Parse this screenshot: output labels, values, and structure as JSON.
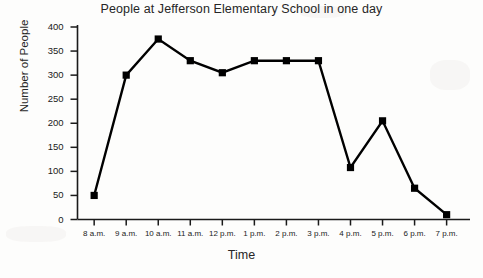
{
  "chart_data": {
    "type": "line",
    "title": "People at Jefferson Elementary School in one day",
    "xlabel": "Time",
    "ylabel": "Number of People",
    "categories": [
      "8 a.m.",
      "9 a.m.",
      "10 a.m.",
      "11 a.m.",
      "12 p.m.",
      "1 p.m.",
      "2 p.m.",
      "3 p.m.",
      "4 p.m.",
      "5 p.m.",
      "6 p.m.",
      "7 p.m."
    ],
    "values": [
      50,
      300,
      375,
      330,
      305,
      330,
      330,
      330,
      108,
      205,
      65,
      10
    ],
    "series": [
      {
        "name": "Number of People",
        "values": [
          50,
          300,
          375,
          330,
          305,
          330,
          330,
          330,
          108,
          205,
          65,
          10
        ]
      }
    ],
    "ylim": [
      0,
      400
    ],
    "yticks": [
      0,
      50,
      100,
      150,
      200,
      250,
      300,
      350,
      400
    ],
    "ytick_labels": [
      "0",
      "50",
      "100",
      "150",
      "200",
      "250",
      "300",
      "350",
      "400"
    ],
    "grid": false,
    "legend": false,
    "marker": "square",
    "line_color": "#000000",
    "marker_color": "#000000",
    "background_color": "#fdfdfc",
    "axis_color": "#1a1a1a"
  }
}
